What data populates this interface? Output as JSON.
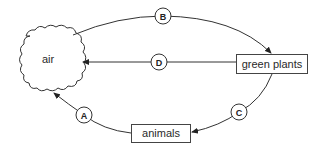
{
  "diagram": {
    "nodes": {
      "air": {
        "label": "air",
        "shape": "cloud"
      },
      "green_plants": {
        "label": "green plants",
        "shape": "rectangle"
      },
      "animals": {
        "label": "animals",
        "shape": "rectangle"
      }
    },
    "arrows": [
      {
        "id": "A",
        "label": "A",
        "from": "animals",
        "to": "air"
      },
      {
        "id": "B",
        "label": "B",
        "from": "air",
        "to": "green plants"
      },
      {
        "id": "C",
        "label": "C",
        "from": "green plants",
        "to": "animals"
      },
      {
        "id": "D",
        "label": "D",
        "from": "green plants",
        "to": "air"
      }
    ],
    "colors": {
      "line": "#333333",
      "background": "#ffffff",
      "text": "#2a2a2a"
    }
  }
}
